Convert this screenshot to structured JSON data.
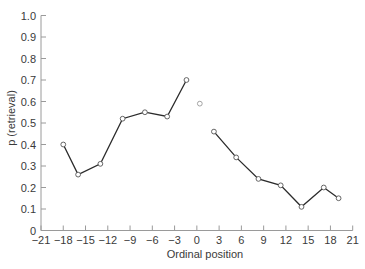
{
  "chart_data": {
    "type": "line",
    "title": "",
    "xlabel": "Ordinal position",
    "ylabel": "p (retrieval)",
    "xlim": [
      -21,
      21
    ],
    "ylim": [
      0,
      1.0
    ],
    "grid": false,
    "legend": null,
    "x_ticks": [
      -21,
      -18,
      -15,
      -12,
      -9,
      -6,
      -3,
      0,
      3,
      6,
      9,
      12,
      15,
      18,
      21
    ],
    "x_tick_labels": [
      "−21",
      "−18",
      "−15",
      "−12",
      "−9",
      "−6",
      "−3",
      "0",
      "3",
      "6",
      "9",
      "12",
      "15",
      "18",
      "21"
    ],
    "y_ticks": [
      0,
      0.1,
      0.2,
      0.3,
      0.4,
      0.5,
      0.6,
      0.7,
      0.8,
      0.9,
      1.0
    ],
    "y_tick_labels": [
      "0",
      "0.1",
      "0.2",
      "0.3",
      "0.4",
      "0.5",
      "0.6",
      "0.7",
      "0.8",
      "0.9",
      "1.0"
    ],
    "series": [
      {
        "name": "before",
        "marker": "open-circle",
        "line": true,
        "x": [
          -18,
          -16,
          -13,
          -10,
          -7,
          -4,
          -1.4
        ],
        "y": [
          0.4,
          0.26,
          0.31,
          0.52,
          0.55,
          0.53,
          0.7
        ]
      },
      {
        "name": "center",
        "marker": "open-circle-light",
        "line": false,
        "x": [
          0.4
        ],
        "y": [
          0.59
        ]
      },
      {
        "name": "after",
        "marker": "open-circle",
        "line": true,
        "x": [
          2.3,
          5.3,
          8.3,
          11.3,
          14.1,
          17.1,
          19.1
        ],
        "y": [
          0.46,
          0.34,
          0.24,
          0.21,
          0.11,
          0.2,
          0.15
        ]
      }
    ],
    "colors": {
      "line": "#2b2b2b",
      "axis": "#9a9a9a",
      "marker_stroke": "#555555",
      "marker_center_stroke": "#9a9a9a",
      "text": "#3a3a3a"
    }
  }
}
